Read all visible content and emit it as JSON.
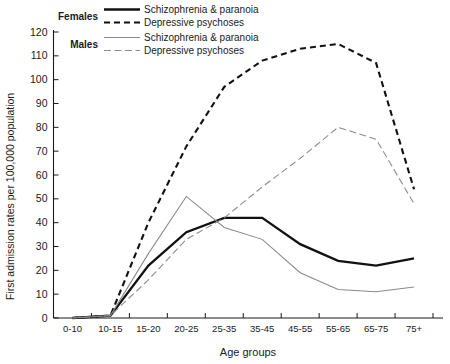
{
  "chart_data": {
    "type": "line",
    "title": "",
    "xlabel": "Age groups",
    "ylabel": "First admission rates per 100,000 population",
    "categories": [
      "0-10",
      "10-15",
      "15-20",
      "20-25",
      "25-35",
      "35-45",
      "45-55",
      "55-65",
      "65-75",
      "75+"
    ],
    "ylim": [
      0,
      120
    ],
    "yticks": [
      0,
      10,
      20,
      30,
      40,
      50,
      60,
      70,
      80,
      90,
      100,
      110,
      120
    ],
    "grid": false,
    "legend_position": "top-left",
    "series": [
      {
        "name": "Females – Schizophrenia & paranoia",
        "group": "Females",
        "label": "Schizophrenia & paranoia",
        "style": "bold-solid",
        "color": "#111111",
        "values": [
          0,
          1,
          22,
          36,
          42,
          42,
          31,
          24,
          22,
          25
        ]
      },
      {
        "name": "Females – Depressive psychoses",
        "group": "Females",
        "label": "Depressive psychoses",
        "style": "bold-dashed",
        "color": "#111111",
        "values": [
          0,
          1,
          40,
          72,
          97,
          108,
          113,
          115,
          107,
          54
        ]
      },
      {
        "name": "Males – Schizophrenia & paranoia",
        "group": "Males",
        "label": "Schizophrenia & paranoia",
        "style": "thin-solid",
        "color": "#8a8a8a",
        "values": [
          0,
          1,
          27,
          51,
          38,
          33,
          19,
          12,
          11,
          13
        ]
      },
      {
        "name": "Males – Depressive psychoses",
        "group": "Males",
        "label": "Depressive psychoses",
        "style": "thin-dashed",
        "color": "#8a8a8a",
        "values": [
          0,
          1,
          16,
          33,
          42,
          55,
          67,
          80,
          75,
          48
        ]
      }
    ]
  },
  "legend": {
    "groups": [
      {
        "group_label": "Females",
        "entries": [
          {
            "label": "Schizophrenia & paranoia",
            "style": "bold-solid"
          },
          {
            "label": "Depressive psychoses",
            "style": "bold-dashed"
          }
        ]
      },
      {
        "group_label": "Males",
        "entries": [
          {
            "label": "Schizophrenia & paranoia",
            "style": "thin-solid"
          },
          {
            "label": "Depressive psychoses",
            "style": "thin-dashed"
          }
        ]
      }
    ]
  },
  "axes": {
    "y_title": "First admission rates per 100,000 population",
    "x_title": "Age groups"
  }
}
